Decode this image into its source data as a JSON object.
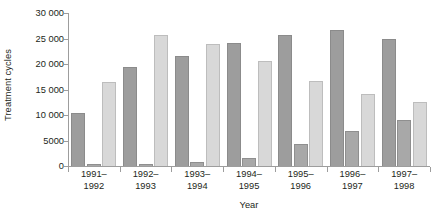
{
  "chart_data": {
    "type": "bar",
    "title": "",
    "xlabel": "Year",
    "ylabel": "Treatment cycles",
    "categories": [
      "1991–\n1992",
      "1992–\n1993",
      "1993–\n1994",
      "1994–\n1995",
      "1995–\n1996",
      "1996–\n1997",
      "1997–\n1998"
    ],
    "category_lines": [
      [
        "1991–",
        "1992"
      ],
      [
        "1992–",
        "1993"
      ],
      [
        "1993–",
        "1994"
      ],
      [
        "1994–",
        "1995"
      ],
      [
        "1995–",
        "1996"
      ],
      [
        "1996–",
        "1997"
      ],
      [
        "1997–",
        "1998"
      ]
    ],
    "series": [
      {
        "name": "series-a",
        "color": "#9d9d9d",
        "values": [
          10400,
          19500,
          21600,
          24200,
          25700,
          26700,
          24900
        ]
      },
      {
        "name": "series-b",
        "color": "#a8a8a8",
        "values": [
          300,
          300,
          700,
          1600,
          4400,
          6800,
          9100
        ]
      },
      {
        "name": "series-c",
        "color": "#d8d8d8",
        "values": [
          16500,
          25600,
          23900,
          20500,
          16700,
          14200,
          12600
        ]
      }
    ],
    "ylim": [
      0,
      30000
    ],
    "ytick_values": [
      0,
      5000,
      10000,
      15000,
      20000,
      25000,
      30000
    ],
    "ytick_labels": [
      "0",
      "5000",
      "10 000",
      "15 000",
      "20 000",
      "25 000",
      "30 000"
    ],
    "grid": false,
    "legend": "none"
  },
  "colors": {
    "axis": "#9d9d9d",
    "text": "#231f20",
    "background": "#ffffff"
  }
}
